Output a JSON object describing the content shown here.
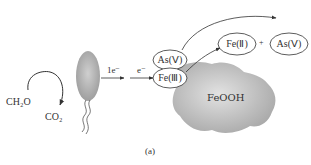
{
  "diagram": {
    "substrate": {
      "reactant": "CH₂O",
      "product": "CO₂"
    },
    "bacterium": {
      "label": "bacterium-cell"
    },
    "electron_transfer": [
      {
        "label": "1e⁻"
      },
      {
        "label": "e⁻"
      }
    ],
    "surface_species": [
      {
        "label": "As(Ⅴ)"
      },
      {
        "label": "Fe(Ⅲ)"
      }
    ],
    "products": [
      {
        "label": "Fe(Ⅱ)"
      },
      {
        "label": "As(Ⅴ)"
      }
    ],
    "plus_sign": "+",
    "mineral": {
      "label": "FeOOH"
    },
    "panel_label": "(a)",
    "colors": {
      "cell_fill": "#a8a8a8",
      "mineral_fill": "#b5b5b5",
      "line": "#333333"
    }
  }
}
